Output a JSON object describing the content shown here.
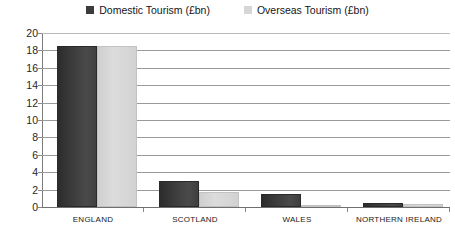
{
  "chart_data": {
    "type": "bar",
    "title": "",
    "xlabel": "",
    "ylabel": "",
    "ylim": [
      0,
      20
    ],
    "ytick_step": 2,
    "yticks": [
      "20",
      "18",
      "16",
      "14",
      "12",
      "10",
      "8",
      "6",
      "4",
      "2",
      "0"
    ],
    "grid": "horizontal",
    "legend_position": "top-center",
    "categories": [
      "ENGLAND",
      "SCOTLAND",
      "WALES",
      "NORTHERN IRELAND"
    ],
    "series": [
      {
        "name": "Domestic Tourism (£bn)",
        "color": "#3b3b3b",
        "values": [
          18.5,
          3.0,
          1.5,
          0.5
        ]
      },
      {
        "name": "Overseas Tourism (£bn)",
        "color": "#d6d6d6",
        "values": [
          18.5,
          1.7,
          0.2,
          0.3
        ]
      }
    ]
  },
  "legend": {
    "entries": [
      {
        "label": "Domestic Tourism (£bn)",
        "swatch": "#3b3b3b"
      },
      {
        "label": "Overseas Tourism (£bn)",
        "swatch": "#d6d6d6"
      }
    ]
  }
}
